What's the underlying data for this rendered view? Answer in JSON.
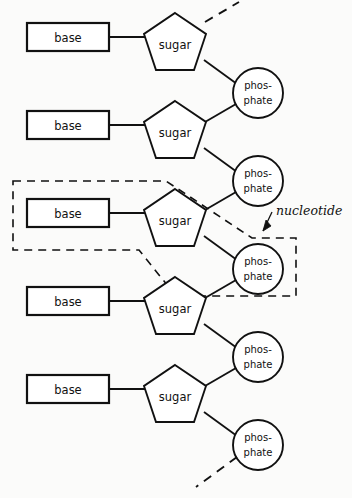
{
  "figure": {
    "background_color": "#fbfbfa",
    "ink_color": "#111111"
  },
  "labels": {
    "base": "base",
    "sugar": "sugar",
    "phosphate_line1": "phos-",
    "phosphate_line2": "phate",
    "callout": "nucleotide"
  },
  "structure": {
    "repeat_count": 5,
    "vertical_spacing": 88,
    "base_label_text": "base",
    "sugar_label_text": "sugar",
    "phosphate_label_text": "phosphate"
  },
  "units": [
    {
      "index": 1,
      "base_y": 37,
      "sugar_cy": 42,
      "phosphate_cy": 93
    },
    {
      "index": 2,
      "base_y": 125,
      "sugar_cy": 130,
      "phosphate_cy": 181
    },
    {
      "index": 3,
      "base_y": 213,
      "sugar_cy": 218,
      "phosphate_cy": 269
    },
    {
      "index": 4,
      "base_y": 301,
      "sugar_cy": 306,
      "phosphate_cy": 357
    },
    {
      "index": 5,
      "base_y": 389,
      "sugar_cy": 394,
      "phosphate_cy": 445
    }
  ],
  "callout": {
    "text": "nucleotide",
    "text_x": 276,
    "text_y": 215,
    "arrow_tip_x": 263,
    "arrow_tip_y": 231
  },
  "chain_ends": {
    "top_dashed": true,
    "bottom_dashed": true
  }
}
